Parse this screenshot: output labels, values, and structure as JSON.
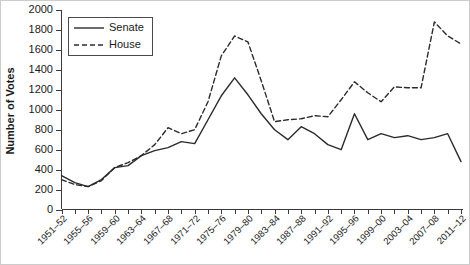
{
  "chart_data": {
    "type": "line",
    "title": "",
    "xlabel": "",
    "ylabel": "Number of Votes",
    "ylim": [
      0,
      2000
    ],
    "yticks": [
      0,
      200,
      400,
      600,
      800,
      1000,
      1200,
      1400,
      1600,
      1800,
      2000
    ],
    "grid": false,
    "legend_position": "top-left",
    "categories": [
      "1951–52",
      "1953–54",
      "1955–56",
      "1957–58",
      "1959–60",
      "1961–62",
      "1963–64",
      "1965–66",
      "1967–68",
      "1969–70",
      "1971–72",
      "1973–74",
      "1975–76",
      "1977–78",
      "1979–80",
      "1981–82",
      "1983–84",
      "1985–86",
      "1987–88",
      "1989–90",
      "1991–92",
      "1993–94",
      "1995–96",
      "1997–98",
      "1999–00",
      "2001–02",
      "2003–04",
      "2005–06",
      "2007–08",
      "2009–10",
      "2011–12"
    ],
    "xtick_labels": [
      "1951–52",
      "1955–56",
      "1959–60",
      "1963–64",
      "1967–68",
      "1971–72",
      "1975–76",
      "1979–80",
      "1983–84",
      "1987–88",
      "1991–92",
      "1995–96",
      "1999–00",
      "2003–04",
      "2007–08",
      "2011–12"
    ],
    "series": [
      {
        "name": "Senate",
        "style": "solid",
        "values": [
          340,
          270,
          230,
          300,
          420,
          440,
          540,
          590,
          620,
          680,
          660,
          900,
          1140,
          1320,
          1150,
          960,
          800,
          700,
          830,
          760,
          650,
          600,
          960,
          700,
          760,
          720,
          740,
          700,
          720,
          760,
          480
        ]
      },
      {
        "name": "House",
        "style": "dashed",
        "values": [
          300,
          250,
          230,
          290,
          420,
          470,
          540,
          650,
          820,
          760,
          800,
          1080,
          1540,
          1740,
          1680,
          1290,
          880,
          900,
          910,
          940,
          930,
          1100,
          1280,
          1170,
          1080,
          1230,
          1220,
          1220,
          1880,
          1740,
          1660
        ]
      }
    ]
  },
  "legend": {
    "items": [
      {
        "label": "Senate",
        "style": "solid"
      },
      {
        "label": "House",
        "style": "dashed"
      }
    ]
  }
}
